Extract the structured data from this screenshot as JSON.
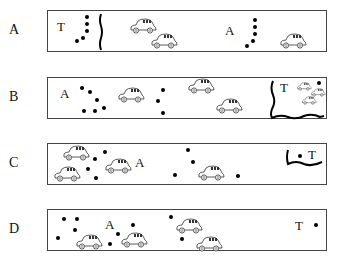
{
  "rows": [
    {
      "label": "A"
    },
    {
      "label": "B"
    },
    {
      "label": "C"
    },
    {
      "label": "D"
    }
  ],
  "markers": {
    "start": "A",
    "target": "T"
  },
  "icons": {
    "dot": "filled-circle",
    "car": "car-icon",
    "wall": "wavy-line-barrier"
  },
  "colors": {
    "ink": "#000000",
    "border": "#444444",
    "background": "#ffffff"
  }
}
